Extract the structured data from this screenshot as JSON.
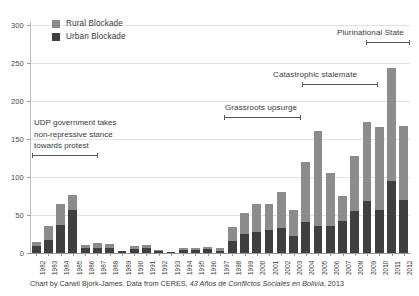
{
  "chart_data": {
    "type": "bar",
    "subtype": "stacked",
    "title": "",
    "xlabel": "",
    "ylabel": "",
    "ylim": [
      0,
      300
    ],
    "yticks": [
      0,
      50,
      100,
      150,
      200,
      250,
      300
    ],
    "grid": true,
    "legend_position": "top-left",
    "categories": [
      "1982",
      "1983",
      "1984",
      "1985",
      "1986",
      "1987",
      "1988",
      "1989",
      "1990",
      "1991",
      "1992",
      "1993",
      "1994",
      "1995",
      "1996",
      "1997",
      "1998",
      "1999",
      "2000",
      "2001",
      "2002",
      "2003",
      "2004",
      "2005",
      "2006",
      "2007",
      "2008",
      "2009",
      "2010",
      "2011",
      "2012"
    ],
    "series": [
      {
        "name": "Urban Blockade",
        "color": "#3f3f3f",
        "values": [
          9,
          17,
          37,
          56,
          6,
          6,
          6,
          2,
          5,
          7,
          3,
          1,
          4,
          4,
          5,
          3,
          16,
          25,
          28,
          30,
          33,
          22,
          41,
          35,
          36,
          42,
          55,
          68,
          57,
          95,
          70
        ]
      },
      {
        "name": "Rural Blockade",
        "color": "#8c8c8c",
        "values": [
          6,
          18,
          28,
          21,
          4,
          7,
          6,
          1,
          4,
          4,
          1,
          0,
          2,
          2,
          3,
          4,
          18,
          27,
          37,
          34,
          47,
          34,
          79,
          125,
          69,
          33,
          73,
          104,
          109,
          148,
          97
        ]
      }
    ],
    "totals": [
      15,
      35,
      65,
      77,
      10,
      13,
      12,
      3,
      9,
      11,
      4,
      1,
      6,
      6,
      8,
      7,
      34,
      52,
      65,
      64,
      80,
      56,
      120,
      160,
      105,
      75,
      128,
      172,
      166,
      243,
      167
    ],
    "annotations": [
      {
        "id": "udp",
        "text_lines": [
          "UDP government takes",
          "non-repressive stance",
          "towards protest"
        ],
        "span_start": "1982",
        "span_end": "1985"
      },
      {
        "id": "grassroots",
        "text": "Grassroots upsurge",
        "span_start": "2000",
        "span_end": "2005"
      },
      {
        "id": "stalemate",
        "text": "Catastrophic stalemate",
        "span_start": "2003",
        "span_end": "2009"
      },
      {
        "id": "plurinational",
        "text": "Plurinational State",
        "span_start": "2010",
        "span_end": "2012"
      }
    ]
  },
  "legend": {
    "items": [
      {
        "label": "Rural Blockade",
        "color": "#8c8c8c"
      },
      {
        "label": "Urban Blockade",
        "color": "#3f3f3f"
      }
    ]
  },
  "annotations": {
    "udp_line1": "UDP government takes",
    "udp_line2": "non-repressive stance",
    "udp_line3": "towards protest",
    "grassroots": "Grassroots upsurge",
    "stalemate": "Catastrophic stalemate",
    "plurinational": "Plurinational State"
  },
  "caption": {
    "prefix": "Chart by Carwil Bjork-James. Data from CERES, ",
    "italic": "43 Años de Conflictos Sociales en Bolivia",
    "suffix": ", 2013"
  },
  "colors": {
    "rural": "#8c8c8c",
    "urban": "#3f3f3f",
    "grid": "#e2e2e2",
    "axis": "#9a9a9a",
    "text": "#3a3a3a"
  }
}
